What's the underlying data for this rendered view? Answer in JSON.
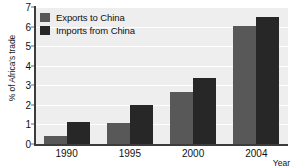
{
  "chart_data": {
    "type": "bar",
    "title": "",
    "xlabel": "Year",
    "ylabel": "% of Africa's trade",
    "categories": [
      "1990",
      "1995",
      "2000",
      "2004"
    ],
    "series": [
      {
        "name": "Exports to China",
        "values": [
          0.4,
          1.05,
          2.65,
          6.05
        ],
        "color": "#585858"
      },
      {
        "name": "Imports from China",
        "values": [
          1.15,
          2.0,
          3.35,
          6.5
        ],
        "color": "#272727"
      }
    ],
    "ylim": [
      0,
      7
    ],
    "yticks": [
      0,
      1,
      2,
      3,
      4,
      5,
      6,
      7
    ],
    "ytick_labels": [
      "0",
      "1",
      "2",
      "3",
      "4",
      "5",
      "6",
      "7"
    ],
    "grid": "horizontal",
    "legend_position": "top-left",
    "plot_background": "#eeeeee",
    "gridline_color": "#ffffff",
    "axis_color": "#3c3c3c"
  }
}
